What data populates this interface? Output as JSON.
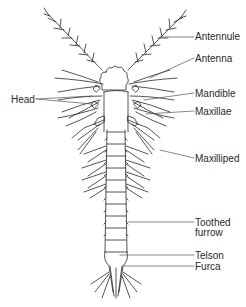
{
  "diagram": {
    "labels": {
      "antennule": "Antennule",
      "antenna": "Antenna",
      "mandible": "Mandible",
      "maxillae": "Maxillae",
      "maxilliped": "Maxilliped",
      "toothed_furrow_line1": "Toothed",
      "toothed_furrow_line2": "furrow",
      "telson": "Telson",
      "furca": "Furca",
      "head": "Head"
    },
    "colors": {
      "ink": "#2a2a2a",
      "leader": "#555555",
      "background": "#ffffff"
    }
  }
}
